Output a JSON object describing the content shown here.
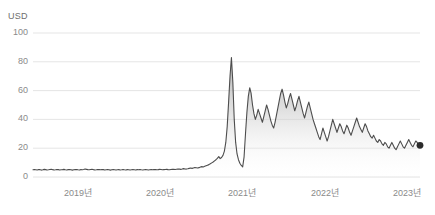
{
  "unit_label": "USD",
  "colors": {
    "line": "#4d4d4d",
    "fill_top": "#b8b8b8",
    "fill_bottom": "#ffffff",
    "gridline": "#e2e2e2",
    "tick_text": "#8a8a8a",
    "end_marker": "#2b2b2b"
  },
  "chart_data": {
    "type": "area",
    "title": "",
    "subtitle": "",
    "xlabel": "",
    "ylabel": "USD",
    "ylim": [
      0,
      100
    ],
    "grid": true,
    "legend": "none",
    "yticks": [
      0,
      20,
      40,
      60,
      80,
      100
    ],
    "xticks": [
      "2019년",
      "2020년",
      "2021년",
      "2022년",
      "2023년"
    ],
    "xtick_positions_px": [
      78,
      160,
      242,
      325,
      407
    ],
    "x_range_labels": [
      "2018",
      "2023"
    ],
    "end_marker_value": 22,
    "series": [
      {
        "name": "USD",
        "values": [
          5.0,
          5.1,
          5.0,
          4.9,
          5.2,
          5.1,
          4.8,
          5.0,
          5.3,
          5.1,
          4.9,
          5.0,
          5.2,
          5.4,
          5.1,
          4.9,
          5.0,
          5.2,
          5.1,
          4.9,
          5.0,
          5.1,
          5.3,
          5.0,
          4.9,
          5.1,
          5.2,
          5.0,
          4.8,
          5.0,
          5.1,
          5.2,
          5.0,
          4.9,
          5.1,
          5.0,
          5.2,
          5.5,
          5.3,
          5.1,
          5.0,
          5.2,
          5.4,
          5.1,
          4.9,
          5.0,
          5.2,
          5.1,
          5.0,
          5.2,
          5.1,
          4.9,
          5.0,
          5.1,
          5.0,
          4.8,
          5.0,
          5.1,
          5.0,
          4.9,
          5.0,
          5.1,
          4.9,
          5.0,
          5.2,
          5.0,
          4.9,
          5.1,
          5.0,
          4.9,
          5.0,
          5.1,
          5.0,
          4.9,
          5.1,
          5.0,
          5.2,
          5.0,
          4.9,
          5.0,
          5.1,
          5.0,
          4.9,
          5.0,
          5.1,
          5.0,
          5.2,
          5.1,
          5.0,
          5.1,
          5.3,
          5.2,
          5.0,
          5.1,
          5.2,
          5.3,
          5.1,
          5.0,
          5.2,
          5.4,
          5.3,
          5.2,
          5.4,
          5.6,
          5.5,
          5.3,
          5.5,
          5.8,
          5.6,
          5.5,
          5.7,
          6.0,
          6.2,
          6.0,
          6.3,
          6.6,
          6.4,
          6.2,
          6.5,
          6.9,
          7.2,
          7.0,
          7.4,
          7.8,
          8.2,
          8.6,
          9.2,
          9.8,
          10.4,
          11.2,
          12.0,
          13.0,
          14.2,
          12.8,
          13.5,
          15.0,
          18.0,
          24.0,
          35.0,
          52.0,
          70.0,
          83.0,
          66.0,
          40.0,
          24.0,
          16.0,
          12.0,
          9.5,
          8.0,
          7.0,
          14.0,
          30.0,
          45.0,
          56.0,
          62.0,
          58.0,
          50.0,
          44.0,
          40.0,
          43.0,
          47.0,
          44.0,
          41.0,
          38.0,
          42.0,
          46.0,
          50.0,
          47.0,
          43.0,
          39.0,
          36.0,
          34.0,
          38.0,
          43.0,
          48.0,
          53.0,
          58.0,
          61.0,
          57.0,
          52.0,
          48.0,
          51.0,
          55.0,
          58.0,
          54.0,
          50.0,
          46.0,
          49.0,
          53.0,
          56.0,
          52.0,
          48.0,
          44.0,
          41.0,
          45.0,
          49.0,
          52.0,
          48.0,
          44.0,
          40.0,
          37.0,
          34.0,
          31.0,
          28.0,
          26.0,
          30.0,
          34.0,
          31.0,
          28.0,
          25.0,
          28.0,
          32.0,
          36.0,
          40.0,
          37.0,
          34.0,
          31.0,
          34.0,
          37.0,
          35.0,
          32.0,
          30.0,
          33.0,
          36.0,
          34.0,
          31.0,
          29.0,
          32.0,
          35.0,
          38.0,
          41.0,
          38.0,
          35.0,
          33.0,
          31.0,
          34.0,
          37.0,
          35.0,
          32.0,
          30.0,
          28.0,
          27.0,
          29.0,
          27.0,
          25.0,
          24.0,
          26.0,
          25.0,
          23.0,
          22.0,
          24.0,
          23.0,
          21.0,
          20.0,
          22.0,
          24.0,
          22.0,
          20.0,
          19.0,
          21.0,
          23.0,
          25.0,
          23.0,
          21.0,
          20.0,
          22.0,
          24.0,
          26.0,
          24.0,
          22.0,
          21.0,
          23.0,
          25.0,
          24.0,
          22.0,
          22.0
        ]
      }
    ]
  }
}
